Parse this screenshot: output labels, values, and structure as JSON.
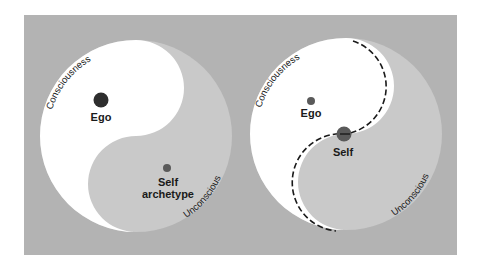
{
  "colors": {
    "background": "#ffffff",
    "panel": "#b3b3b3",
    "conscious_region": "#ffffff",
    "unconscious_region": "#c9c9c9",
    "ego_dot": "#2e2e2e",
    "self_dot": "#5a5a5a",
    "text": "#1a1a1a"
  },
  "diagrams": [
    {
      "id": "left",
      "arc_top_label": "Consciousness",
      "arc_bottom_label": "Unconscious",
      "ego_label": "Ego",
      "self_label_line1": "Self",
      "self_label_line2": "archetype",
      "boundary_style": "solid"
    },
    {
      "id": "right",
      "arc_top_label": "Consciousness",
      "arc_bottom_label": "Unconscious",
      "ego_label": "Ego",
      "self_label_line1": "Self",
      "boundary_style": "dashed"
    }
  ]
}
